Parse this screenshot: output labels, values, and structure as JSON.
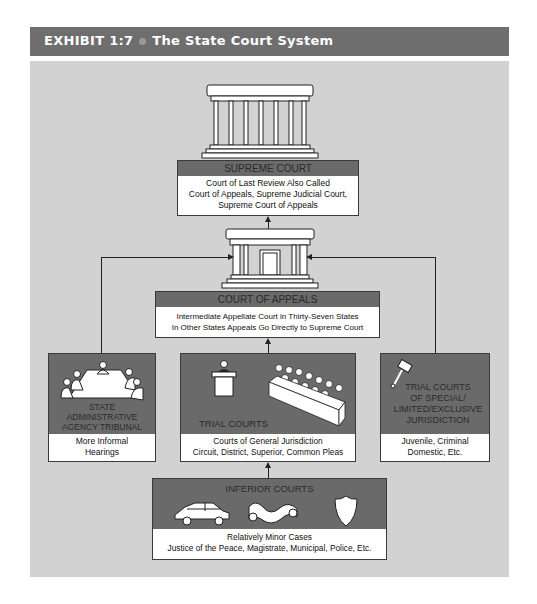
{
  "header": {
    "exhibit": "EXHIBIT 1:7",
    "title": "The State Court System"
  },
  "supreme_court": {
    "title": "SUPREME COURT",
    "lines": [
      "Court of Last Review Also Called",
      "Court of Appeals, Supreme Judicial Court,",
      "Supreme Court of Appeals"
    ],
    "icon": "courthouse-columns-icon"
  },
  "court_of_appeals": {
    "title": "COURT OF APPEALS",
    "lines": [
      "Intermediate Appellate Court in Thirty-Seven States",
      "In Other States Appeals Go Directly to Supreme Court"
    ],
    "icon": "courthouse-door-icon"
  },
  "state_admin": {
    "title_lines": [
      "STATE",
      "ADMINISTRATIVE",
      "AGENCY TRIBUNAL"
    ],
    "lines": [
      "More Informal",
      "Hearings"
    ],
    "icon": "conference-table-icon"
  },
  "trial_courts": {
    "title": "TRIAL COURTS",
    "lines": [
      "Courts of General Jurisdiction",
      "Circuit, District, Superior, Common Pleas"
    ],
    "icons": [
      "podium-icon",
      "jury-box-icon"
    ]
  },
  "special_trial": {
    "title_lines": [
      "TRIAL COURTS",
      "OF SPECIAL/",
      "LIMITED/EXCLUSIVE",
      "JURISDICTION"
    ],
    "lines": [
      "Juvenile, Criminal",
      "Domestic, Etc."
    ],
    "icon": "gavel-icon"
  },
  "inferior_courts": {
    "title": "INFERIOR COURTS",
    "lines": [
      "Relatively Minor Cases",
      "Justice of the Peace, Magistrate, Municipal, Police, Etc."
    ],
    "icons": [
      "car-icon",
      "scroll-icon",
      "badge-shield-icon"
    ]
  },
  "colors": {
    "header_bg": "#6e6e6e",
    "panel_bg": "#d2d2d2",
    "box_head": "#6a6a6a",
    "box_body": "#ffffff"
  }
}
